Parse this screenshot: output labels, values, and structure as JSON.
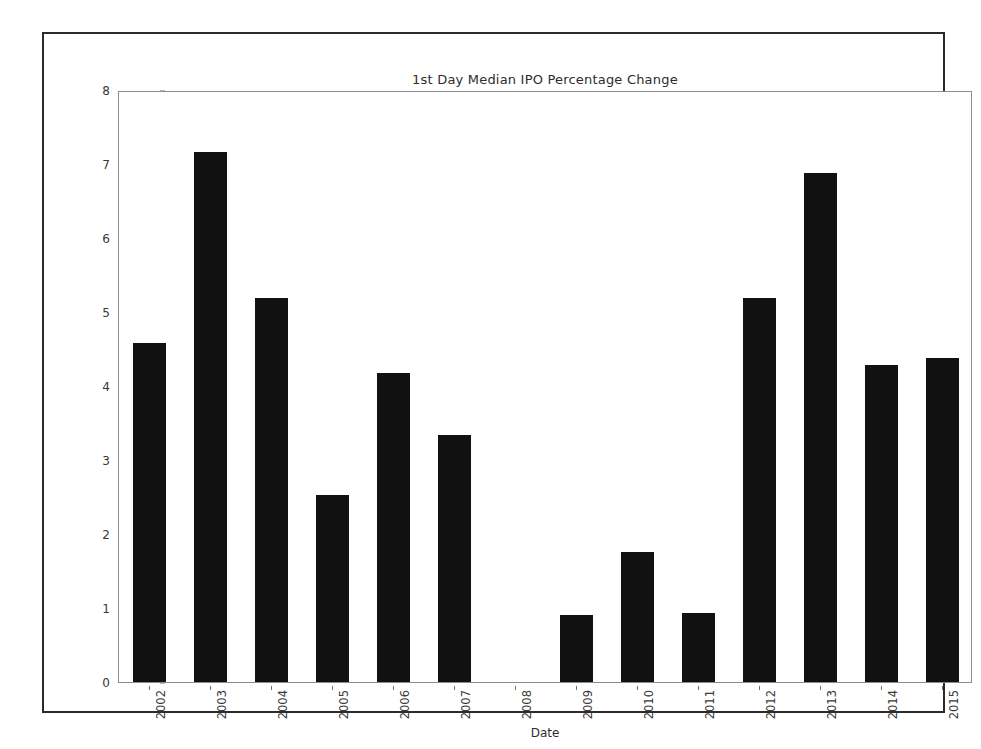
{
  "chart_data": {
    "type": "bar",
    "title": "1st Day Median IPO Percentage Change",
    "xlabel": "Date",
    "ylabel": "",
    "categories": [
      "2002",
      "2003",
      "2004",
      "2005",
      "2006",
      "2007",
      "2008",
      "2009",
      "2010",
      "2011",
      "2012",
      "2013",
      "2014",
      "2015"
    ],
    "values": [
      4.58,
      7.16,
      5.19,
      2.53,
      4.17,
      3.34,
      0.0,
      0.9,
      1.76,
      0.93,
      5.19,
      6.88,
      4.28,
      4.38
    ],
    "ylim": [
      0,
      8
    ],
    "yticks": [
      0,
      1,
      2,
      3,
      4,
      5,
      6,
      7,
      8
    ],
    "ytick_labels": [
      "0",
      "1",
      "2",
      "3",
      "4",
      "5",
      "6",
      "7",
      "8"
    ],
    "grid": false,
    "legend": null,
    "bar_color": "#111111",
    "axis_color": "#8d8d8d",
    "frame_color": "#2b2b2b",
    "bar_width_ratio": 0.53,
    "xtick_rotation": -90
  }
}
